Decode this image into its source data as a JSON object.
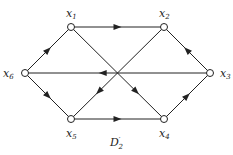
{
  "diagram": {
    "caption": {
      "main": "D",
      "sup": "′",
      "sub": "2"
    },
    "nodes": [
      {
        "id": "x1",
        "label": "x",
        "sub": "1",
        "x": 71,
        "y": 27
      },
      {
        "id": "x2",
        "label": "x",
        "sub": "2",
        "x": 164,
        "y": 27
      },
      {
        "id": "x3",
        "label": "x",
        "sub": "3",
        "x": 210,
        "y": 73
      },
      {
        "id": "x4",
        "label": "x",
        "sub": "4",
        "x": 164,
        "y": 119
      },
      {
        "id": "x5",
        "label": "x",
        "sub": "5",
        "x": 71,
        "y": 119
      },
      {
        "id": "x6",
        "label": "x",
        "sub": "6",
        "x": 25,
        "y": 73
      }
    ],
    "edges": [
      {
        "from": "x1",
        "to": "x2"
      },
      {
        "from": "x3",
        "to": "x2"
      },
      {
        "from": "x6",
        "to": "x1"
      },
      {
        "from": "x3",
        "to": "x6"
      },
      {
        "from": "x2",
        "to": "x5"
      },
      {
        "from": "x1",
        "to": "x4"
      },
      {
        "from": "x6",
        "to": "x5"
      },
      {
        "from": "x5",
        "to": "x4"
      },
      {
        "from": "x4",
        "to": "x3"
      }
    ]
  }
}
